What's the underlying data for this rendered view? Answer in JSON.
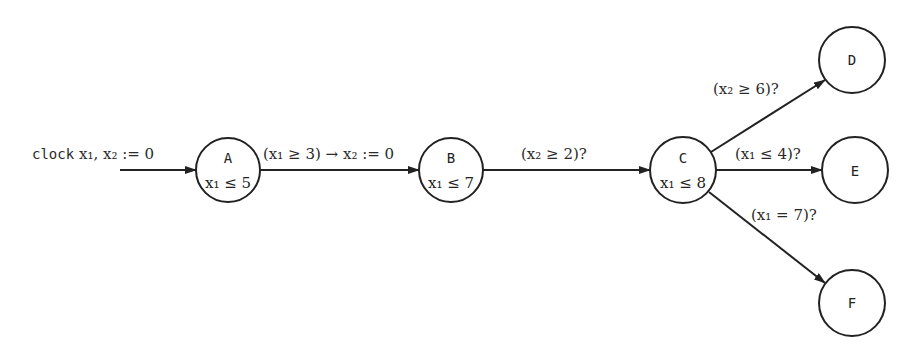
{
  "init": {
    "keyword": "clock",
    "text": "x₁, x₂ := 0"
  },
  "states": [
    {
      "id": "A",
      "invariant": "x₁ ≤ 5",
      "cx": 228,
      "cy": 170,
      "r": 32
    },
    {
      "id": "B",
      "invariant": "x₁ ≤ 7",
      "cx": 451,
      "cy": 170,
      "r": 32
    },
    {
      "id": "C",
      "invariant": "x₁ ≤ 8",
      "cx": 683,
      "cy": 170,
      "r": 33
    },
    {
      "id": "D",
      "invariant": "",
      "cx": 852,
      "cy": 60,
      "r": 33
    },
    {
      "id": "E",
      "invariant": "",
      "cx": 855,
      "cy": 170,
      "r": 33
    },
    {
      "id": "F",
      "invariant": "",
      "cx": 852,
      "cy": 303,
      "r": 33
    }
  ],
  "transitions": [
    {
      "from": "A",
      "to": "B",
      "label": "(x₁ ≥ 3) → x₂ := 0"
    },
    {
      "from": "B",
      "to": "C",
      "label": "(x₂ ≥ 2)?"
    },
    {
      "from": "C",
      "to": "D",
      "label": "(x₂ ≥ 6)?"
    },
    {
      "from": "C",
      "to": "E",
      "label": "(x₁ ≤ 4)?"
    },
    {
      "from": "C",
      "to": "F",
      "label": "(x₁ = 7)?"
    }
  ]
}
